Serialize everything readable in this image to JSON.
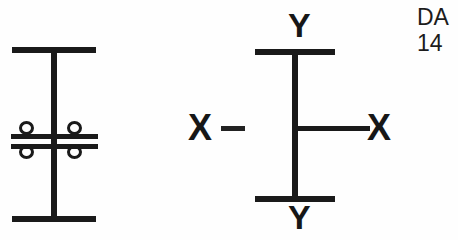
{
  "page": {
    "width": 458,
    "height": 240,
    "background_color": "#fefefe",
    "ink_color": "#1a1a1a"
  },
  "figures": {
    "bolted_beam": {
      "name": "I-beam cross-section with bolted splice plates",
      "parts": {
        "top_flange": "top-flange",
        "bottom_flange": "bottom-flange",
        "web": "web",
        "upper_splice_plate": "upper-splice-plate",
        "lower_splice_plate": "lower-splice-plate"
      },
      "bolts": [
        {
          "id": "bolt-top-left",
          "position": "top-left"
        },
        {
          "id": "bolt-top-right",
          "position": "top-right"
        },
        {
          "id": "bolt-bottom-left",
          "position": "bottom-left"
        },
        {
          "id": "bolt-bottom-right",
          "position": "bottom-right"
        }
      ],
      "bolt_count": 4
    },
    "axes_beam": {
      "name": "I-beam cross-section with principal axes",
      "parts": {
        "top_flange": "top-flange",
        "bottom_flange": "bottom-flange",
        "web": "web",
        "x_axis_line": "x-axis-line",
        "x_axis_dash": "x-axis-dash"
      },
      "labels": {
        "y_top": "Y",
        "y_bottom": "Y",
        "x_left": "X",
        "x_right": "X"
      }
    }
  },
  "caption": {
    "lines": [
      "DA",
      "14"
    ]
  }
}
